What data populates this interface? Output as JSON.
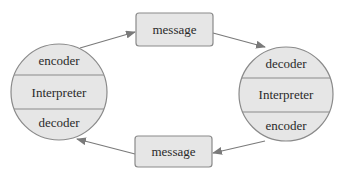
{
  "diagram": {
    "left_node": {
      "sections": [
        "encoder",
        "Interpreter",
        "decoder"
      ]
    },
    "right_node": {
      "sections": [
        "decoder",
        "Interpreter",
        "encoder"
      ]
    },
    "top_message": {
      "label": "message"
    },
    "bottom_message": {
      "label": "message"
    },
    "colors": {
      "fill": "#e6e6e6",
      "stroke": "#8a8a8a",
      "arrow": "#7a7a7a",
      "text": "#2a2a2a"
    }
  }
}
